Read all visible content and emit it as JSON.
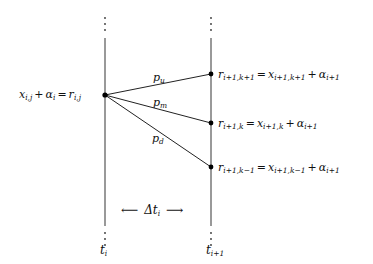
{
  "diagram": {
    "type": "trinomial-tree-step",
    "left_node": {
      "label_lhs": "x",
      "label_lhs_sub": "i,j",
      "label_plus": "+",
      "label_alpha": "α",
      "label_alpha_sub": "i",
      "label_eq": "=",
      "label_rhs": "r",
      "label_rhs_sub": "i,j"
    },
    "right_nodes": [
      {
        "r": "r",
        "r_sub": "i+1,k+1",
        "eq": "=",
        "x": "x",
        "x_sub": "i+1,k+1",
        "plus": "+",
        "alpha": "α",
        "alpha_sub": "i+1"
      },
      {
        "r": "r",
        "r_sub": "i+1,k",
        "eq": "=",
        "x": "x",
        "x_sub": "i+1,k",
        "plus": "+",
        "alpha": "α",
        "alpha_sub": "i+1"
      },
      {
        "r": "r",
        "r_sub": "i+1,k−1",
        "eq": "=",
        "x": "x",
        "x_sub": "i+1,k−1",
        "plus": "+",
        "alpha": "α",
        "alpha_sub": "i+1"
      }
    ],
    "probabilities": [
      {
        "p": "p",
        "sub": "u"
      },
      {
        "p": "p",
        "sub": "m"
      },
      {
        "p": "p",
        "sub": "d"
      }
    ],
    "interval": {
      "left_arrow": "⟵",
      "delta": "Δt",
      "delta_sub": "i",
      "right_arrow": "⟶"
    },
    "time_labels": [
      {
        "t": "t",
        "sub": "i"
      },
      {
        "t": "t",
        "sub": "i+1"
      }
    ],
    "ellipsis": "⋮"
  }
}
